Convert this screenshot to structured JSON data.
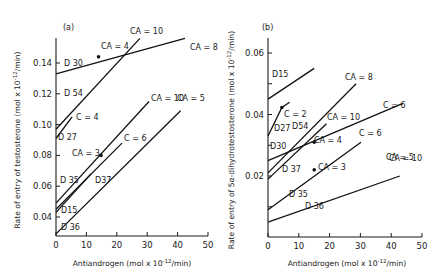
{
  "chart_data": [
    {
      "type": "line",
      "panel_label": "(a)",
      "xlabel": "Antiandrogen (mol x 10^-12/min)",
      "xlabel_parts": {
        "base": "Antiandrogen (mol x 10",
        "sup": "-12",
        "tail": "/min)"
      },
      "ylabel": "Rate of entry of testosterone (mol x 10^-12/min)",
      "ylabel_parts": {
        "base": "Rate of entry of testosterone (mol x 10",
        "sup": "-12",
        "tail": "/min)"
      },
      "xlim": [
        0,
        50
      ],
      "ylim": [
        0.028,
        0.16
      ],
      "xticks": [
        0,
        10,
        20,
        30,
        40,
        50
      ],
      "xtick_labels": [
        "0",
        "10",
        "20",
        "30",
        "40",
        "50"
      ],
      "yticks": [
        0.04,
        0.06,
        0.08,
        0.1,
        0.12,
        0.14
      ],
      "ytick_labels": [
        "0.04",
        "0.06",
        "0.08",
        "0.10",
        "0.12",
        "0.14"
      ],
      "grid": false,
      "series": [
        {
          "name": "D 30",
          "x": [
            0,
            42.4
          ],
          "y": [
            0.133,
            0.156
          ],
          "start_label": "D 30",
          "end_label": "CA = 8",
          "markers": [
            {
              "x": 14,
              "y": 0.144,
              "label": "CA = 4"
            }
          ]
        },
        {
          "name": "D 54",
          "x": [
            0,
            27.6
          ],
          "y": [
            0.097,
            0.156
          ],
          "start_label": "D 54",
          "end_label": "CA = 10",
          "markers": []
        },
        {
          "name": "D 27",
          "x": [
            0,
            5.3
          ],
          "y": [
            0.091,
            0.105
          ],
          "start_label": "D 27",
          "end_label": "C = 4",
          "markers": []
        },
        {
          "name": "D 35",
          "x": [
            0,
            30.6
          ],
          "y": [
            0.049,
            0.115
          ],
          "start_label": "D 35",
          "end_label": "CA = 10",
          "markers": [
            {
              "x": 14.8,
              "y": 0.08,
              "label": "CA = 3"
            }
          ]
        },
        {
          "name": "D37",
          "x": [
            0,
            21.7
          ],
          "y": [
            0.045,
            0.088
          ],
          "start_label": "D37",
          "end_label": "C = 6",
          "markers": []
        },
        {
          "name": "D15",
          "x": [
            0,
            11.5
          ],
          "y": [
            0.043,
            0.068
          ],
          "start_label": "D15",
          "end_label": "",
          "markers": []
        },
        {
          "name": "D 36",
          "x": [
            0,
            41
          ],
          "y": [
            0.029,
            0.109
          ],
          "start_label": "D 36",
          "end_label": "CA = 5",
          "markers": []
        }
      ]
    },
    {
      "type": "line",
      "panel_label": "(b)",
      "xlabel": "Antiandrogen (mol x 10^-12/min)",
      "xlabel_parts": {
        "base": "Antiandrogen (mol x 10",
        "sup": "-12",
        "tail": "/min)"
      },
      "ylabel": "Rate of entry of 5α-dihydrotestosterone (mol x 10^-12/min)",
      "ylabel_parts": {
        "base": "Rate of entry of 5α-dihydrotestosterone (mol x 10",
        "sup": "-12",
        "tail": "/min)"
      },
      "xlim": [
        0,
        50
      ],
      "ylim": [
        0,
        0.066
      ],
      "xticks": [
        0,
        10,
        20,
        30,
        40,
        50
      ],
      "xtick_labels": [
        "0",
        "10",
        "20",
        "30",
        "40",
        "50"
      ],
      "yticks": [
        0.01,
        0.02,
        0.03,
        0.04,
        0.05,
        0.06
      ],
      "ytick_labels": [
        "",
        "0.02",
        "",
        "0.04",
        "",
        "0.06"
      ],
      "grid": false,
      "series": [
        {
          "name": "D15",
          "x": [
            0,
            15
          ],
          "y": [
            0.045,
            0.055
          ],
          "start_label": "D15",
          "end_label": "",
          "markers": []
        },
        {
          "name": "D27",
          "x": [
            0,
            4.5,
            7
          ],
          "y": [
            0.033,
            0.0423,
            0.044
          ],
          "start_label": "D27",
          "end_label": "C = 6",
          "markers": [
            {
              "x": 4.5,
              "y": 0.0423,
              "label": "C = 2"
            }
          ]
        },
        {
          "name": "D30",
          "x": [
            0,
            43.8
          ],
          "y": [
            0.025,
            0.0436
          ],
          "start_label": "D30",
          "end_label": "CA = 8",
          "markers": [
            {
              "x": 15,
              "y": 0.031,
              "label": "CA = 4"
            }
          ]
        },
        {
          "name": "D54",
          "x": [
            0,
            28.6
          ],
          "y": [
            0.021,
            0.05
          ],
          "start_label": "D54",
          "end_label": "CA = 10",
          "markers": []
        },
        {
          "name": "D 37",
          "x": [
            0,
            19
          ],
          "y": [
            0.019,
            0.037
          ],
          "start_label": "D 37",
          "end_label": "C = 6",
          "markers": []
        },
        {
          "name": "D 35",
          "x": [
            0,
            30.2
          ],
          "y": [
            0.009,
            0.031
          ],
          "start_label": "D 35",
          "end_label": "CA = 10",
          "markers": [
            {
              "x": 15,
              "y": 0.022,
              "label": "CA = 3"
            }
          ]
        },
        {
          "name": "D 36",
          "x": [
            0,
            42.8
          ],
          "y": [
            0.005,
            0.02
          ],
          "start_label": "D 36",
          "end_label": "CA = 5",
          "markers": []
        }
      ]
    }
  ]
}
